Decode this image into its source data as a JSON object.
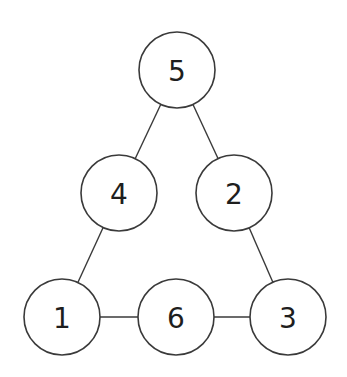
{
  "diagram": {
    "type": "number-triangle",
    "colors": {
      "stroke": "#3a3a3a",
      "text": "#1e1e1e",
      "background": "#ffffff"
    },
    "nodes": [
      {
        "id": "n5",
        "label": "5",
        "cx": 177,
        "cy": 70
      },
      {
        "id": "n4",
        "label": "4",
        "cx": 119,
        "cy": 193
      },
      {
        "id": "n2",
        "label": "2",
        "cx": 234,
        "cy": 193
      },
      {
        "id": "n1",
        "label": "1",
        "cx": 62,
        "cy": 317
      },
      {
        "id": "n6",
        "label": "6",
        "cx": 176,
        "cy": 317
      },
      {
        "id": "n3",
        "label": "3",
        "cx": 288,
        "cy": 317
      }
    ],
    "edges": [
      {
        "from": "n5",
        "to": "n4"
      },
      {
        "from": "n5",
        "to": "n2"
      },
      {
        "from": "n4",
        "to": "n1"
      },
      {
        "from": "n2",
        "to": "n3"
      },
      {
        "from": "n1",
        "to": "n6"
      },
      {
        "from": "n6",
        "to": "n3"
      }
    ],
    "radius": 38
  }
}
